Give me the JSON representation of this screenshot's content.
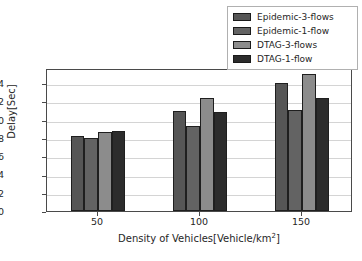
{
  "chart_data": {
    "type": "bar",
    "title": "",
    "xlabel": "Density of Vehicles[Vehicle/km²]",
    "xlabel_base": "Density of Vehicles[Vehicle/km",
    "xlabel_sup": "2",
    "xlabel_tail": "]",
    "ylabel": "Delay[Sec]",
    "categories": [
      "50",
      "100",
      "150"
    ],
    "series": [
      {
        "name": "Epidemic-3-flows",
        "color": "#565656",
        "values": [
          0.82,
          1.1,
          1.4
        ]
      },
      {
        "name": "Epidemic-1-flow",
        "color": "#636363",
        "values": [
          0.8,
          0.93,
          1.11
        ]
      },
      {
        "name": "DTAG-3-flows",
        "color": "#8c8c8c",
        "values": [
          0.86,
          1.24,
          1.5
        ]
      },
      {
        "name": "DTAG-1-flow",
        "color": "#2c2c2c",
        "values": [
          0.88,
          1.08,
          1.24
        ]
      }
    ],
    "ylim": [
      0.0,
      1.566
    ],
    "yticks": [
      0.0,
      0.2,
      0.4,
      0.6,
      0.8,
      1.0,
      1.2,
      1.4
    ],
    "ytick_labels": [
      "0.0",
      "0.2",
      "0.4",
      "0.6",
      "0.8",
      "1.0",
      "1.2",
      "1.4"
    ],
    "grid": true,
    "grid_axis": "y",
    "legend_position": "upper right (outside axes)",
    "bar_edge_color": "#1f1f1f",
    "axes_edge_color": "#4a4a4a",
    "grid_color": "#d4d4d4",
    "background_color": "#ffffff"
  },
  "legend": {
    "items": [
      {
        "label": "Epidemic-3-flows",
        "swatch": "legend-swatch-epidemic-3-flows"
      },
      {
        "label": "Epidemic-1-flow",
        "swatch": "legend-swatch-epidemic-1-flow"
      },
      {
        "label": "DTAG-3-flows",
        "swatch": "legend-swatch-dtag-3-flows"
      },
      {
        "label": "DTAG-1-flow",
        "swatch": "legend-swatch-dtag-1-flow"
      }
    ]
  }
}
